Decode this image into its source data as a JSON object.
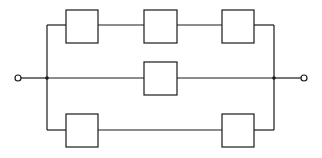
{
  "diagram": {
    "type": "series-parallel block diagram",
    "colors": {
      "stroke": "#1a1a1a",
      "background": "#ffffff"
    },
    "terminals": [
      {
        "id": "input",
        "x": 18,
        "y": 78
      },
      {
        "id": "output",
        "x": 304,
        "y": 78
      }
    ],
    "junctions": [
      {
        "id": "left",
        "x": 47,
        "y": 78
      },
      {
        "id": "right",
        "x": 274,
        "y": 78
      }
    ],
    "branches": [
      {
        "name": "top",
        "y": 25,
        "blocks": [
          {
            "x": 66,
            "y": 10,
            "w": 32,
            "h": 33
          },
          {
            "x": 144,
            "y": 10,
            "w": 33,
            "h": 33
          },
          {
            "x": 222,
            "y": 10,
            "w": 32,
            "h": 33
          }
        ]
      },
      {
        "name": "middle",
        "y": 78,
        "blocks": [
          {
            "x": 144,
            "y": 62,
            "w": 33,
            "h": 33
          }
        ]
      },
      {
        "name": "bottom",
        "y": 130,
        "blocks": [
          {
            "x": 66,
            "y": 114,
            "w": 32,
            "h": 33
          },
          {
            "x": 222,
            "y": 114,
            "w": 32,
            "h": 33
          }
        ]
      }
    ]
  }
}
